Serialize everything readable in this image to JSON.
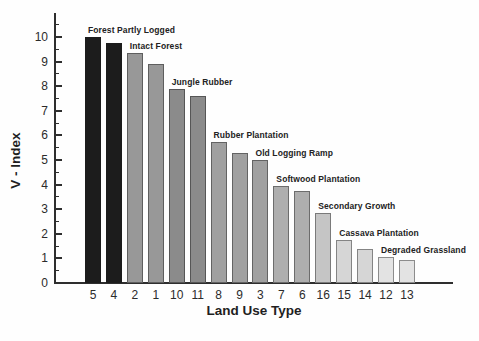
{
  "chart_data": {
    "type": "bar",
    "title": "",
    "xlabel": "Land Use Type",
    "ylabel": "V - Index",
    "ylim": [
      0,
      11
    ],
    "yticks": [
      0,
      1,
      2,
      3,
      4,
      5,
      6,
      7,
      8,
      9,
      10
    ],
    "ytick_minor_step": 0.5,
    "grid": "off",
    "legend": "none",
    "categories": [
      "5",
      "4",
      "2",
      "1",
      "10",
      "11",
      "8",
      "9",
      "3",
      "7",
      "6",
      "16",
      "15",
      "14",
      "12",
      "13"
    ],
    "values": [
      10.0,
      9.75,
      9.35,
      8.9,
      7.9,
      7.6,
      5.75,
      5.3,
      5.0,
      3.95,
      3.75,
      2.85,
      1.75,
      1.4,
      1.05,
      0.95
    ],
    "bar_colors": [
      "#1c1c1c",
      "#1c1c1c",
      "#989898",
      "#989898",
      "#8b8b8b",
      "#8b8b8b",
      "#a0a0a0",
      "#a0a0a0",
      "#a0a0a0",
      "#aeaeae",
      "#aeaeae",
      "#c5c5c5",
      "#d6d6d6",
      "#d6d6d6",
      "#e3e3e3",
      "#e3e3e3"
    ],
    "axis_color": "#2e2e2e",
    "text_color": "#2b2b2b",
    "annotations": [
      {
        "label": "Forest Partly Logged",
        "bar_index": 0
      },
      {
        "label": "Intact Forest",
        "bar_index": 2
      },
      {
        "label": "Jungle Rubber",
        "bar_index": 4
      },
      {
        "label": "Rubber Plantation",
        "bar_index": 6
      },
      {
        "label": "Old Logging Ramp",
        "bar_index": 8
      },
      {
        "label": "Softwood Plantation",
        "bar_index": 9
      },
      {
        "label": "Secondary Growth",
        "bar_index": 11
      },
      {
        "label": "Cassava Plantation",
        "bar_index": 12
      },
      {
        "label": "Degraded Grassland",
        "bar_index": 14
      }
    ]
  }
}
